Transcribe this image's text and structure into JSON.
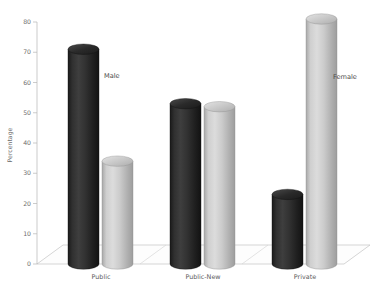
{
  "chart_data": {
    "type": "bar",
    "title": "",
    "subtitle": "",
    "xlabel": "",
    "ylabel": "Percentage",
    "categories": [
      "Public",
      "Public-New",
      "Private"
    ],
    "series": [
      {
        "name": "Male",
        "values": [
          71,
          53,
          23
        ],
        "color": "#2b2b2b"
      },
      {
        "name": "Female",
        "values": [
          34,
          52,
          81
        ],
        "color": "#c2c2c2"
      }
    ],
    "ylim": [
      0,
      80
    ],
    "yticks": [
      0,
      10,
      20,
      30,
      40,
      50,
      60,
      70,
      80
    ],
    "ytick_labels": [
      "0",
      "10",
      "20",
      "30",
      "40",
      "50",
      "60",
      "70",
      "80"
    ],
    "grid": false,
    "legend": "none",
    "legend_position": "inline-annotations",
    "annotations": [
      {
        "text": "Male",
        "series": "Male",
        "near_category": "Public"
      },
      {
        "text": "Female",
        "series": "Female",
        "near_category": "Private"
      }
    ],
    "style": "3d-cylinder",
    "background_color": "#ffffff"
  },
  "axis": {
    "y_title": "Percentage"
  }
}
